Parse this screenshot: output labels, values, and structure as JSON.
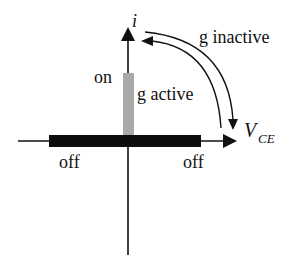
{
  "diagram": {
    "type": "switch i-V characteristic",
    "axes": {
      "vertical_label": "i",
      "horizontal_label_main": "V",
      "horizontal_label_sub": "CE"
    },
    "labels": {
      "on": "on",
      "off_left": "off",
      "off_right": "off",
      "g_active": "g active",
      "g_inactive": "g inactive"
    },
    "colors": {
      "axis": "#111111",
      "off_bar": "#0d0d0d",
      "on_bar": "#a9a9a9",
      "background": "#ffffff"
    }
  }
}
